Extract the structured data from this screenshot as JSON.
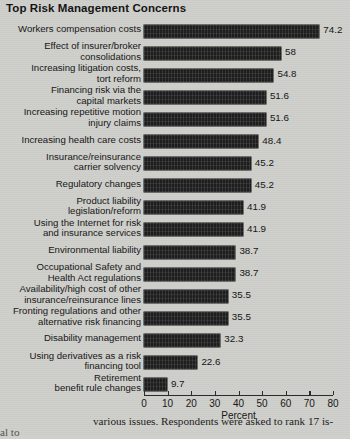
{
  "chart_data": {
    "type": "bar",
    "orientation": "horizontal",
    "title": "Top Risk Management Concerns",
    "xlabel": "Percent",
    "ylabel": "",
    "xlim": [
      0,
      80
    ],
    "xticks": [
      0,
      10,
      20,
      30,
      40,
      50,
      60,
      70,
      80
    ],
    "grid": false,
    "legend": null,
    "bar_color": "#1d1d1d",
    "background_color": "#cfcfcb",
    "categories": [
      "Workers compensation costs",
      "Effect of insurer/broker\nconsolidations",
      "Increasing litigation costs,\ntort reform",
      "Financing risk via the\ncapital markets",
      "Increasing repetitive motion\ninjury claims",
      "Increasing health care costs",
      "Insurance/reinsurance\ncarrier solvency",
      "Regulatory changes",
      "Product liability\nlegislation/reform",
      "Using the Internet for risk\nand insurance services",
      "Environmental liability",
      "Occupational Safety and\nHealth Act regulations",
      "Availability/high cost of other\ninsurance/reinsurance lines",
      "Fronting regulations and other\nalternative risk financing",
      "Disability management",
      "Using derivatives as a risk\nfinancing tool",
      "Retirement\nbenefit rule changes"
    ],
    "values": [
      74.2,
      58,
      54.8,
      51.6,
      51.6,
      48.4,
      45.2,
      45.2,
      41.9,
      41.9,
      38.7,
      38.7,
      35.5,
      35.5,
      32.3,
      22.6,
      9.7
    ],
    "value_labels": [
      "74.2",
      "58",
      "54.8",
      "51.6",
      "51.6",
      "48.4",
      "45.2",
      "45.2",
      "41.9",
      "41.9",
      "38.7",
      "38.7",
      "35.5",
      "35.5",
      "32.3",
      "22.6",
      "9.7"
    ]
  },
  "page": {
    "body_text": "various issues. Respondents were asked to rank 17 is-",
    "body_fragment": "al to"
  }
}
